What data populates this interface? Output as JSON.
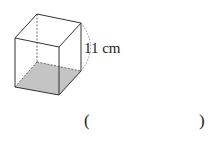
{
  "figure": {
    "shape": "cube",
    "edge_label": "11 cm",
    "shaded_face": "bottom",
    "colors": {
      "edge": "#333333",
      "shade": "#bdbdbd"
    }
  },
  "answer": {
    "open": "(",
    "close": ")",
    "value": ""
  }
}
